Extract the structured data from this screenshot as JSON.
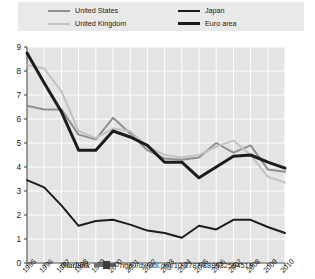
{
  "legend": {
    "left_column": [
      {
        "label": "United States",
        "swatch": "us"
      },
      {
        "label": "United Kingdom",
        "swatch": "uk"
      }
    ],
    "right_column": [
      {
        "label": "Japan",
        "swatch": "jp"
      },
      {
        "label": "Euro area",
        "swatch": "ea"
      }
    ]
  },
  "statlink": {
    "word": "StatLink",
    "glyph": "statlink-barcode-icon",
    "url": "http://dx.doi.org/10.1787/888932504519"
  },
  "chart_data": {
    "type": "line",
    "title": "",
    "subtitle": "",
    "xlabel": "",
    "ylabel": "",
    "grid": true,
    "legend_position": "top",
    "categories": [
      "1995",
      "1996",
      "1997",
      "1998",
      "1999",
      "2000",
      "2001",
      "2002",
      "2003",
      "2004",
      "2005",
      "2006",
      "2007",
      "2008",
      "2009",
      "2010"
    ],
    "xtick_labels": [
      "1995",
      "1996",
      "1997",
      "1998",
      "1999",
      "2000",
      "2001",
      "2002",
      "2003",
      "2004",
      "2005",
      "2006",
      "2007",
      "2008",
      "2009",
      "2010"
    ],
    "ytick_labels": [
      "0",
      "1",
      "2",
      "3",
      "4",
      "5",
      "6",
      "7",
      "8",
      "9"
    ],
    "ylim": [
      0,
      9
    ],
    "ytick_step": 1,
    "series": [
      {
        "name": "United States",
        "color": "#8f8f8f",
        "width": 2.0,
        "values": [
          6.55,
          6.4,
          6.4,
          5.35,
          5.15,
          6.05,
          5.4,
          4.7,
          4.35,
          4.3,
          4.4,
          5.0,
          4.6,
          4.9,
          3.9,
          3.8
        ]
      },
      {
        "name": "United Kingdom",
        "color": "#c2c2c2",
        "width": 2.0,
        "values": [
          8.25,
          8.1,
          7.15,
          5.5,
          5.2,
          5.6,
          5.5,
          4.85,
          4.5,
          4.4,
          4.5,
          4.85,
          5.1,
          4.5,
          3.6,
          3.35
        ]
      },
      {
        "name": "Japan",
        "color": "#1c1c1c",
        "width": 2.0,
        "values": [
          3.45,
          3.15,
          2.4,
          1.55,
          1.75,
          1.8,
          1.6,
          1.35,
          1.25,
          1.05,
          1.55,
          1.4,
          1.8,
          1.8,
          1.5,
          1.25
        ]
      },
      {
        "name": "Euro area",
        "color": "#1c1c1c",
        "width": 3.0,
        "values": [
          8.75,
          7.5,
          6.3,
          4.7,
          4.7,
          5.5,
          5.25,
          4.9,
          4.2,
          4.2,
          3.55,
          4.0,
          4.45,
          4.5,
          4.2,
          3.95
        ]
      }
    ]
  }
}
